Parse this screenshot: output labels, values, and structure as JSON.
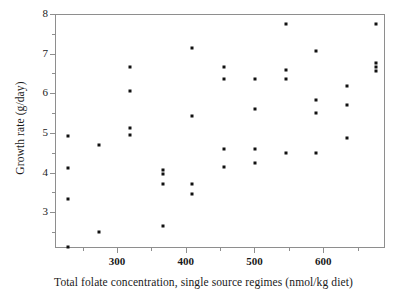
{
  "chart_data": {
    "type": "scatter",
    "title": "",
    "xlabel": "Total folate concentration, single source regimes (nmol/kg diet)",
    "ylabel": "Growth rate (g/day)",
    "xlim": [
      210,
      690
    ],
    "ylim": [
      2.1,
      8.0
    ],
    "xticks": [
      300,
      400,
      500,
      600
    ],
    "xtick_labels": [
      "300",
      "400",
      "500",
      "600"
    ],
    "yticks": [
      3,
      4,
      5,
      6,
      7,
      8
    ],
    "ytick_labels": [
      "3",
      "4",
      "5",
      "6",
      "7",
      "8"
    ],
    "minor_ticks": true,
    "grid": false,
    "legend": null,
    "marker": "square",
    "marker_color": "#111111",
    "marker_size_px": 3,
    "frame_color": "#8e8e8e",
    "background": "#ffffff",
    "points": [
      {
        "x": 228,
        "y": 4.95
      },
      {
        "x": 228,
        "y": 4.15
      },
      {
        "x": 228,
        "y": 3.35
      },
      {
        "x": 228,
        "y": 2.15
      },
      {
        "x": 272,
        "y": 4.72
      },
      {
        "x": 272,
        "y": 2.52
      },
      {
        "x": 318,
        "y": 6.7
      },
      {
        "x": 318,
        "y": 6.08
      },
      {
        "x": 318,
        "y": 5.15
      },
      {
        "x": 318,
        "y": 4.98
      },
      {
        "x": 365,
        "y": 4.08
      },
      {
        "x": 365,
        "y": 3.98
      },
      {
        "x": 365,
        "y": 3.75
      },
      {
        "x": 365,
        "y": 2.68
      },
      {
        "x": 408,
        "y": 7.18
      },
      {
        "x": 408,
        "y": 5.45
      },
      {
        "x": 408,
        "y": 3.75
      },
      {
        "x": 408,
        "y": 3.48
      },
      {
        "x": 455,
        "y": 6.7
      },
      {
        "x": 455,
        "y": 6.38
      },
      {
        "x": 455,
        "y": 4.62
      },
      {
        "x": 455,
        "y": 4.18
      },
      {
        "x": 500,
        "y": 6.38
      },
      {
        "x": 500,
        "y": 5.62
      },
      {
        "x": 500,
        "y": 4.62
      },
      {
        "x": 500,
        "y": 4.28
      },
      {
        "x": 545,
        "y": 7.78
      },
      {
        "x": 545,
        "y": 6.62
      },
      {
        "x": 545,
        "y": 6.38
      },
      {
        "x": 545,
        "y": 4.52
      },
      {
        "x": 588,
        "y": 7.08
      },
      {
        "x": 588,
        "y": 5.85
      },
      {
        "x": 588,
        "y": 5.52
      },
      {
        "x": 588,
        "y": 4.52
      },
      {
        "x": 633,
        "y": 6.22
      },
      {
        "x": 633,
        "y": 5.72
      },
      {
        "x": 633,
        "y": 4.9
      },
      {
        "x": 675,
        "y": 7.78
      },
      {
        "x": 675,
        "y": 6.78
      },
      {
        "x": 675,
        "y": 6.7
      },
      {
        "x": 675,
        "y": 6.58
      }
    ]
  }
}
